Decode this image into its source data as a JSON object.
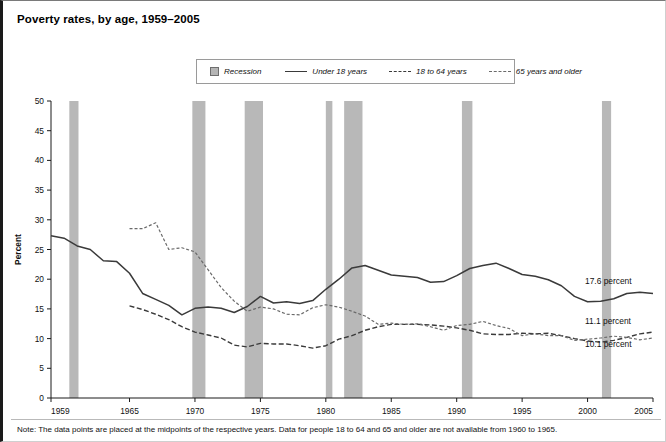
{
  "title": "Poverty rates, by age, 1959–2005",
  "note": "Note: The data points are placed at the midpoints of the respective years. Data for people 18 to 64 and 65 and older are not available from 1960 to 1965.",
  "legend": {
    "items": [
      {
        "label": "Recession",
        "style": "swatch",
        "color": "#b5b5b5"
      },
      {
        "label": "Under 18 years",
        "style": "solid",
        "color": "#3a3a3a"
      },
      {
        "label": "18 to 64 years",
        "style": "dashed",
        "color": "#3a3a3a"
      },
      {
        "label": "65 years and older",
        "style": "dotted",
        "color": "#6a6a6a"
      }
    ]
  },
  "end_labels": [
    {
      "text": "17.6 percent",
      "series": "Under 18 years"
    },
    {
      "text": "11.1 percent",
      "series": "65 years and older"
    },
    {
      "text": "10.1 percent",
      "series": "18 to 64 years"
    }
  ],
  "chart_data": {
    "type": "line",
    "title": "Poverty rates, by age, 1959–2005",
    "xlabel": "",
    "ylabel": "Percent",
    "xlim": [
      1959,
      2005
    ],
    "ylim": [
      0,
      50
    ],
    "grid": false,
    "legend_position": "top-center",
    "yticks": [
      0,
      5,
      10,
      15,
      20,
      25,
      30,
      35,
      40,
      45,
      50
    ],
    "xticks": [
      1959,
      1965,
      1970,
      1975,
      1980,
      1985,
      1990,
      1995,
      2000,
      2005
    ],
    "recession_bands": [
      {
        "start": 1960.4,
        "end": 1961.1
      },
      {
        "start": 1969.8,
        "end": 1970.8
      },
      {
        "start": 1973.8,
        "end": 1975.2
      },
      {
        "start": 1980.0,
        "end": 1980.5
      },
      {
        "start": 1981.4,
        "end": 1982.8
      },
      {
        "start": 1990.4,
        "end": 1991.2
      },
      {
        "start": 2001.1,
        "end": 2001.8
      }
    ],
    "x": [
      1959,
      1960,
      1961,
      1962,
      1963,
      1964,
      1965,
      1966,
      1967,
      1968,
      1969,
      1970,
      1971,
      1972,
      1973,
      1974,
      1975,
      1976,
      1977,
      1978,
      1979,
      1980,
      1981,
      1982,
      1983,
      1984,
      1985,
      1986,
      1987,
      1988,
      1989,
      1990,
      1991,
      1992,
      1993,
      1994,
      1995,
      1996,
      1997,
      1998,
      1999,
      2000,
      2001,
      2002,
      2003,
      2004,
      2005
    ],
    "series": [
      {
        "name": "Under 18 years",
        "style": "solid",
        "color": "#3a3a3a",
        "end_value": 17.6,
        "values": [
          27.3,
          26.9,
          25.6,
          25.0,
          23.1,
          23.0,
          21.0,
          17.6,
          16.6,
          15.6,
          14.0,
          15.1,
          15.3,
          15.1,
          14.4,
          15.4,
          17.1,
          16.0,
          16.2,
          15.9,
          16.4,
          18.3,
          20.0,
          21.9,
          22.3,
          21.5,
          20.7,
          20.5,
          20.3,
          19.5,
          19.6,
          20.6,
          21.8,
          22.3,
          22.7,
          21.8,
          20.8,
          20.5,
          19.9,
          18.9,
          17.1,
          16.2,
          16.3,
          16.7,
          17.6,
          17.8,
          17.6
        ]
      },
      {
        "name": "18 to 64 years",
        "style": "dashed",
        "color": "#3a3a3a",
        "end_value": 10.1,
        "values": [
          17.0,
          null,
          null,
          null,
          null,
          null,
          15.5,
          14.9,
          14.1,
          13.2,
          12.0,
          11.1,
          10.6,
          10.1,
          8.9,
          8.6,
          9.2,
          9.1,
          9.1,
          8.8,
          8.4,
          8.8,
          9.9,
          10.5,
          11.4,
          12.0,
          12.4,
          12.4,
          12.4,
          12.3,
          12.1,
          11.8,
          11.4,
          10.8,
          10.7,
          10.7,
          10.9,
          10.8,
          10.9,
          10.5,
          10.0,
          9.6,
          9.4,
          9.7,
          10.2,
          10.8,
          11.1
        ]
      },
      {
        "name": "65 years and older",
        "style": "dotted",
        "color": "#6a6a6a",
        "end_value": 11.1,
        "values": [
          35.2,
          null,
          null,
          null,
          null,
          null,
          28.5,
          28.5,
          29.5,
          25.0,
          25.3,
          24.6,
          21.6,
          18.6,
          16.3,
          14.6,
          15.3,
          15.0,
          14.1,
          14.0,
          15.2,
          15.7,
          15.3,
          14.6,
          13.8,
          12.4,
          12.6,
          12.4,
          12.5,
          12.0,
          11.4,
          12.2,
          12.4,
          12.9,
          12.2,
          11.7,
          10.5,
          10.8,
          10.5,
          10.5,
          9.7,
          9.9,
          10.1,
          10.4,
          10.2,
          9.8,
          10.1
        ]
      }
    ]
  }
}
